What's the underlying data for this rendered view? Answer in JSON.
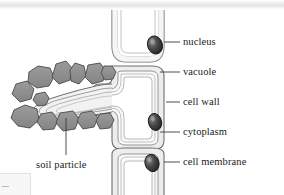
{
  "figure": {
    "background_color": "#ffffff",
    "top_band_color": "#e4e4e4"
  },
  "colors": {
    "outline": "#6f6f6f",
    "outline_dark": "#3a3a3a",
    "cell_wall_fill": "#e9e9e9",
    "cytoplasm_fill": "#f4f4f4",
    "vacuole_fill": "#ffffff",
    "nucleus_fill": "#2e2e2e",
    "soil_particle_fill": "#8f8f8f",
    "soil_particle_stroke": "#4a4a4a",
    "leader_line": "#3a3a3a",
    "label_text": "#1b1b1b"
  },
  "labels": {
    "nucleus": "nucleus",
    "vacuole": "vacuole",
    "cell_wall": "cell wall",
    "cytoplasm": "cytoplasm",
    "cell_membrane": "cell membrane",
    "soil_particle": "soil particle"
  },
  "parts": [
    {
      "id": "nucleus",
      "label": "nucleus",
      "leader_from_x": 167,
      "leader_to_x": 180,
      "leader_y": 42,
      "count": 3
    },
    {
      "id": "vacuole",
      "label": "vacuole",
      "leader_from_x": 163,
      "leader_to_x": 180,
      "leader_y": 72,
      "count": 3
    },
    {
      "id": "cell_wall",
      "label": "cell wall",
      "leader_from_x": 168,
      "leader_to_x": 180,
      "leader_y": 102,
      "count": 1
    },
    {
      "id": "cytoplasm",
      "label": "cytoplasm",
      "leader_from_x": 163,
      "leader_to_x": 180,
      "leader_y": 132,
      "count": 3
    },
    {
      "id": "cell_membrane",
      "label": "cell membrane",
      "leader_from_x": 167,
      "leader_to_x": 180,
      "leader_y": 162,
      "count": 3
    }
  ],
  "soil": {
    "label": "soil particle",
    "leader_x": 66,
    "leader_top_y": 118,
    "leader_bottom_y": 155,
    "particle_count": 12
  },
  "cells": [
    {
      "id": "upper-cell",
      "nucleus": true
    },
    {
      "id": "middle-cell",
      "nucleus": true
    },
    {
      "id": "lower-cell",
      "nucleus": true
    }
  ]
}
